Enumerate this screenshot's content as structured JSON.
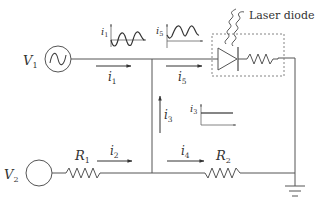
{
  "diagram": {
    "sources": [
      {
        "id": "V1",
        "label": "V",
        "subscript": "1",
        "type": "ac-voltage-source"
      },
      {
        "id": "V2",
        "label": "V",
        "subscript": "2",
        "type": "dc-voltage-source"
      }
    ],
    "resistors": [
      {
        "id": "R1",
        "label": "R",
        "subscript": "1"
      },
      {
        "id": "R2",
        "label": "R",
        "subscript": "2"
      }
    ],
    "laser_diode": {
      "label": "Laser diode"
    },
    "currents": [
      {
        "id": "i1",
        "label": "i",
        "subscript": "1",
        "direction": "right",
        "waveform": "sinusoidal"
      },
      {
        "id": "i2",
        "label": "i",
        "subscript": "2",
        "direction": "right"
      },
      {
        "id": "i3",
        "label": "i",
        "subscript": "3",
        "direction": "up",
        "waveform": "constant"
      },
      {
        "id": "i4",
        "label": "i",
        "subscript": "4",
        "direction": "right"
      },
      {
        "id": "i5",
        "label": "i",
        "subscript": "5",
        "direction": "right",
        "waveform": "sinusoidal-offset"
      }
    ],
    "insets": [
      {
        "id": "i1-plot",
        "label": "i",
        "subscript": "1"
      },
      {
        "id": "i5-plot",
        "label": "i",
        "subscript": "5"
      },
      {
        "id": "i3-plot",
        "label": "i",
        "subscript": "3"
      }
    ],
    "ground": {
      "label": "ground"
    }
  }
}
